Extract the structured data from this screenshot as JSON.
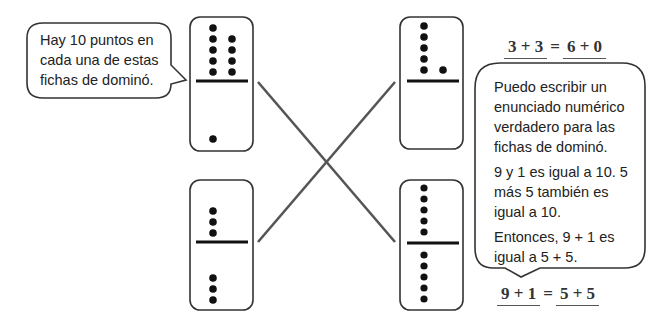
{
  "left_bubble": {
    "lines": [
      "Hay 10 puntos en",
      "cada una de estas",
      "fichas de dominó."
    ]
  },
  "right_bubble": {
    "paragraphs": [
      [
        "Puedo escribir un",
        "enunciado numérico",
        "verdadero para las",
        "fichas de dominó."
      ],
      [
        "9 y 1 es igual a 10.  5",
        "más  5 también es",
        "igual a 10."
      ],
      [
        "Entonces, 9 + 1 es",
        "igual a 5 + 5."
      ]
    ]
  },
  "equations": {
    "top": {
      "left": "3 + 3",
      "sign": "=",
      "right": "6 + 0"
    },
    "bottom": {
      "left": "9 + 1",
      "sign": "=",
      "right": "5 + 5"
    }
  },
  "dominoes": [
    {
      "id": "top-left",
      "top": 9,
      "bottom": 1
    },
    {
      "id": "top-right",
      "top": 6,
      "bottom": 0
    },
    {
      "id": "bottom-left",
      "top": 3,
      "bottom": 3
    },
    {
      "id": "bottom-right",
      "top": 5,
      "bottom": 5
    }
  ],
  "matches": [
    {
      "from": "top-left",
      "to": "bottom-right"
    },
    {
      "from": "bottom-left",
      "to": "top-right"
    }
  ],
  "colors": {
    "outline": "#333333",
    "dot": "#111111",
    "connector": "#555555"
  }
}
